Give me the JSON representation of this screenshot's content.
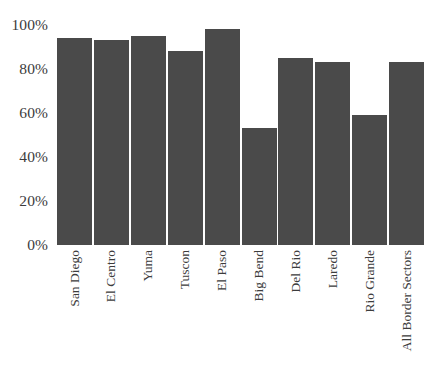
{
  "chart_data": {
    "type": "bar",
    "title": "",
    "subtitle": "",
    "xlabel": "",
    "ylabel": "",
    "categories": [
      "San Diego",
      "El Centro",
      "Yuma",
      "Tuscon",
      "El Paso",
      "Big Bend",
      "Del Rio",
      "Laredo",
      "Rio Grande",
      "All Border Sectors"
    ],
    "values": [
      94,
      93,
      95,
      88,
      98,
      53,
      85,
      83,
      59,
      83
    ],
    "value_unit": "%",
    "ylim": [
      0,
      100
    ],
    "ytick_values": [
      0,
      20,
      40,
      60,
      80,
      100
    ],
    "ytick_labels": [
      "0%",
      "20%",
      "40%",
      "60%",
      "80%",
      "100%"
    ],
    "grid": false,
    "legend": false,
    "legend_position": "none",
    "bar_color": "#4a4a4a",
    "background_color": "#ffffff",
    "xtick_label_rotation": 90,
    "annotations": []
  }
}
